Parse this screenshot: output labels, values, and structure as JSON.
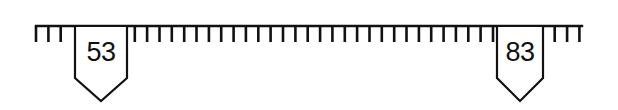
{
  "diagram": {
    "type": "number-line-ruler",
    "colors": {
      "stroke": "#111111",
      "background": "#ffffff"
    },
    "ruler": {
      "line_y": 26,
      "x_start": 36,
      "x_end": 582,
      "tick_spacing": 12.35,
      "tick_length": 16
    },
    "markers": [
      {
        "label": "53",
        "center_x": 101,
        "box_left": 75,
        "box_right": 127,
        "box_bottom": 78,
        "point_y": 101
      },
      {
        "label": "83",
        "center_x": 520,
        "box_left": 497,
        "box_right": 543,
        "box_bottom": 78,
        "point_y": 101
      }
    ]
  }
}
